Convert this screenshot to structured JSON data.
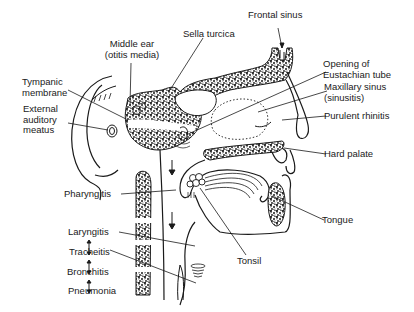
{
  "diagram": {
    "colors": {
      "ink": "#1a1a1a",
      "background": "#ffffff"
    },
    "labels": {
      "frontal_sinus": "Frontal sinus",
      "sella_turcica": "Sella turcica",
      "middle_ear_line1": "Middle ear",
      "middle_ear_line2": "(otitis media)",
      "tympanic_line1": "Tympanic",
      "tympanic_line2": "membrane",
      "external_line1": "External",
      "external_line2": "auditory",
      "external_line3": "meatus",
      "eustachian_line1": "Opening of",
      "eustachian_line2": "Eustachian tube",
      "maxillary_line1": "Maxillary sinus",
      "maxillary_line2": "(sinusitis)",
      "purulent_rhinitis": "Purulent rhinitis",
      "hard_palate": "Hard palate",
      "pharyngitis": "Pharyngitis",
      "tongue": "Tongue",
      "tonsil": "Tonsil",
      "laryngitis": "Laryngitis",
      "tracheitis": "Tracheitis",
      "bronchitis": "Bronchitis",
      "pneumonia": "Pneumonia"
    },
    "progression": [
      "Laryngitis",
      "Tracheitis",
      "Bronchitis",
      "Pneumonia"
    ]
  }
}
